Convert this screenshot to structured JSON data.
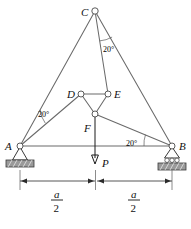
{
  "figure": {
    "colors": {
      "member": "#6a6a6a",
      "joint_fill": "#ffffff",
      "joint_stroke": "#4a4a4a",
      "ground_hatch": "#9a9a9a",
      "text": "#111111",
      "dimension": "#2b2b2b"
    },
    "nodes": [
      {
        "id": "C",
        "label": "C",
        "x": 95,
        "y": 11,
        "label_x": 81,
        "label_y": 13,
        "support": "none"
      },
      {
        "id": "D",
        "label": "D",
        "x": 81,
        "y": 94,
        "label_x": 68,
        "label_y": 96,
        "support": "none"
      },
      {
        "id": "E",
        "label": "E",
        "x": 108,
        "y": 94,
        "label_x": 114,
        "label_y": 96,
        "support": "none"
      },
      {
        "id": "F",
        "label": "F",
        "x": 95,
        "y": 114,
        "label_x": 83,
        "label_y": 128,
        "support": "none"
      },
      {
        "id": "A",
        "label": "A",
        "x": 20,
        "y": 146,
        "label_x": 6,
        "label_y": 148,
        "support": "pin"
      },
      {
        "id": "B",
        "label": "B",
        "x": 172,
        "y": 146,
        "label_x": 180,
        "label_y": 148,
        "support": "roller"
      }
    ],
    "members": [
      {
        "from": "A",
        "to": "C"
      },
      {
        "from": "C",
        "to": "B"
      },
      {
        "from": "A",
        "to": "B"
      },
      {
        "from": "A",
        "to": "D"
      },
      {
        "from": "C",
        "to": "E"
      },
      {
        "from": "D",
        "to": "E"
      },
      {
        "from": "D",
        "to": "F"
      },
      {
        "from": "E",
        "to": "F"
      },
      {
        "from": "F",
        "to": "B"
      }
    ],
    "angles": [
      {
        "id": "angle-at-c",
        "value": "20",
        "unit": "deg",
        "label": "20°",
        "label_x": 103,
        "label_y": 49,
        "vertex": "C",
        "between": [
          "C-E",
          "C-B"
        ]
      },
      {
        "id": "angle-at-a",
        "value": "20",
        "unit": "deg",
        "label": "20°",
        "label_x": 38,
        "label_y": 115,
        "vertex": "A",
        "between": [
          "A-C",
          "A-D"
        ]
      },
      {
        "id": "angle-at-b",
        "value": "20",
        "unit": "deg",
        "label": "20°",
        "label_x": 127,
        "label_y": 144,
        "vertex": "B",
        "between": [
          "B-A",
          "B-F"
        ]
      }
    ],
    "load": {
      "label": "P",
      "label_x": 103,
      "label_y": 166,
      "from_node": "F",
      "tip_x": 95,
      "tip_y": 163,
      "direction": "down"
    },
    "dimensions": [
      {
        "id": "dim-left",
        "numerator": "a",
        "denominator": "2",
        "x_start": 20,
        "x_end": 95,
        "text_x": 57,
        "text_y": 198,
        "y": 180
      },
      {
        "id": "dim-right",
        "numerator": "a",
        "denominator": "2",
        "x_start": 96,
        "x_end": 172,
        "text_x": 134,
        "text_y": 198,
        "y": 180
      }
    ],
    "supports": {
      "pin_label": "pin-support",
      "roller_label": "roller-support"
    }
  }
}
